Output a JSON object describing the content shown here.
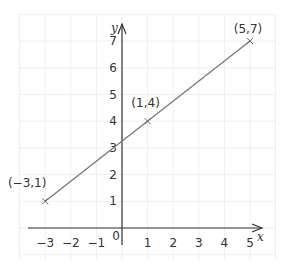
{
  "chart_data": {
    "type": "line",
    "title": "",
    "xlabel": "x",
    "ylabel": "y",
    "xlim": [
      -3,
      5
    ],
    "ylim": [
      0,
      7
    ],
    "grid": true,
    "x_ticks": [
      "−3",
      "−2",
      "−1",
      "1",
      "2",
      "3",
      "4",
      "5"
    ],
    "x_tick_values": [
      -3,
      -2,
      -1,
      1,
      2,
      3,
      4,
      5
    ],
    "y_ticks": [
      "1",
      "2",
      "3",
      "4",
      "5",
      "6",
      "7"
    ],
    "y_tick_values": [
      1,
      2,
      3,
      4,
      5,
      6,
      7
    ],
    "origin_label": "0",
    "series": [
      {
        "name": "line",
        "x": [
          -3,
          5
        ],
        "y": [
          1,
          7
        ],
        "color": "#777777"
      }
    ],
    "points": [
      {
        "x": -3,
        "y": 1,
        "label": "(−3,1)"
      },
      {
        "x": 1,
        "y": 4,
        "label": "(1,4)"
      },
      {
        "x": 5,
        "y": 7,
        "label": "(5,7)"
      }
    ],
    "colors": {
      "axis": "#333333",
      "line": "#777777",
      "grid": "#eeeeee"
    }
  }
}
